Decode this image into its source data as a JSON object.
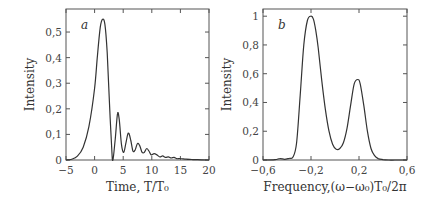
{
  "chart_data": [
    {
      "type": "line",
      "panel_label": "a",
      "title": "",
      "xlabel": "Time,  T/T₀",
      "ylabel": "Intensity",
      "xlim": [
        -5,
        20
      ],
      "ylim": [
        0,
        0.59
      ],
      "xticks": [
        -5,
        0,
        5,
        10,
        15,
        20
      ],
      "xtick_labels": [
        "−5",
        "0",
        "5",
        "10",
        "15",
        "20"
      ],
      "yticks": [
        0,
        0.1,
        0.2,
        0.3,
        0.4,
        0.5
      ],
      "ytick_labels": [
        "0",
        "0,1",
        "0,2",
        "0,3",
        "0,4",
        "0,5"
      ],
      "grid": false,
      "series": [
        {
          "name": "intensity",
          "x": [
            -5,
            -4,
            -3,
            -2,
            -1,
            0,
            0.5,
            1,
            1.4,
            1.8,
            2.2,
            2.6,
            3.0,
            3.2,
            3.6,
            4.0,
            4.3,
            4.7,
            5.1,
            5.5,
            5.9,
            6.3,
            6.7,
            7.1,
            7.5,
            7.9,
            8.3,
            8.7,
            9.1,
            9.5,
            9.9,
            10.4,
            10.9,
            11.4,
            11.9,
            12.4,
            12.9,
            13.4,
            13.9,
            14.4,
            15,
            16,
            17,
            18,
            20
          ],
          "y": [
            0,
            0.003,
            0.015,
            0.05,
            0.13,
            0.28,
            0.41,
            0.52,
            0.55,
            0.53,
            0.42,
            0.22,
            0.04,
            0.0,
            0.08,
            0.18,
            0.16,
            0.06,
            0.03,
            0.07,
            0.105,
            0.08,
            0.035,
            0.04,
            0.065,
            0.055,
            0.03,
            0.03,
            0.045,
            0.035,
            0.02,
            0.025,
            0.02,
            0.012,
            0.016,
            0.01,
            0.012,
            0.008,
            0.01,
            0.005,
            0.006,
            0.003,
            0.002,
            0.001,
            0
          ]
        }
      ]
    },
    {
      "type": "line",
      "panel_label": "b",
      "title": "",
      "xlabel": "Frequency,(ω−ω₀)T₀/2π",
      "ylabel": "Intensity",
      "xlim": [
        -0.6,
        0.6
      ],
      "ylim": [
        0,
        1.05
      ],
      "xticks": [
        -0.6,
        -0.2,
        0.2,
        0.6
      ],
      "xtick_labels": [
        "−0,6",
        "−0,2",
        "0,2",
        "0,6"
      ],
      "yticks": [
        0,
        0.2,
        0.4,
        0.6,
        0.8,
        1.0
      ],
      "ytick_labels": [
        "0",
        "0,2",
        "0,4",
        "0,6",
        "0,8",
        "1"
      ],
      "grid": false,
      "series": [
        {
          "name": "spectrum",
          "x": [
            -0.6,
            -0.5,
            -0.46,
            -0.42,
            -0.38,
            -0.35,
            -0.32,
            -0.29,
            -0.26,
            -0.23,
            -0.2,
            -0.18,
            -0.16,
            -0.14,
            -0.11,
            -0.08,
            -0.05,
            -0.02,
            0.01,
            0.04,
            0.07,
            0.1,
            0.13,
            0.16,
            0.19,
            0.21,
            0.24,
            0.27,
            0.3,
            0.33,
            0.36,
            0.4,
            0.45,
            0.5,
            0.6
          ],
          "y": [
            0,
            0.002,
            0.01,
            0.005,
            0.012,
            0.02,
            0.12,
            0.45,
            0.8,
            0.97,
            1.0,
            0.98,
            0.9,
            0.78,
            0.55,
            0.35,
            0.2,
            0.11,
            0.075,
            0.08,
            0.12,
            0.22,
            0.38,
            0.53,
            0.56,
            0.53,
            0.38,
            0.2,
            0.08,
            0.03,
            0.01,
            0.003,
            0,
            0,
            0
          ]
        }
      ]
    }
  ]
}
